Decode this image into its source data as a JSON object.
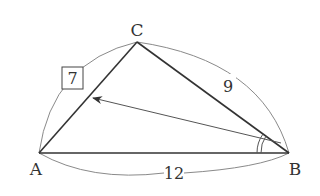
{
  "diagram": {
    "type": "triangle",
    "vertices": {
      "A": {
        "label": "A",
        "x": 39,
        "y": 153
      },
      "B": {
        "label": "B",
        "x": 289,
        "y": 153
      },
      "C": {
        "label": "C",
        "x": 137,
        "y": 42
      }
    },
    "sides": {
      "AB": {
        "label": "12"
      },
      "BC": {
        "label": "9"
      },
      "CA": {
        "label": "7",
        "boxed": true
      }
    },
    "angle_mark": {
      "vertex": "B",
      "style": "double-arc"
    },
    "arrow": {
      "from": "B",
      "to": "side CA"
    },
    "colors": {
      "edge": "#333333",
      "arc": "#888888",
      "text": "#333333"
    }
  }
}
